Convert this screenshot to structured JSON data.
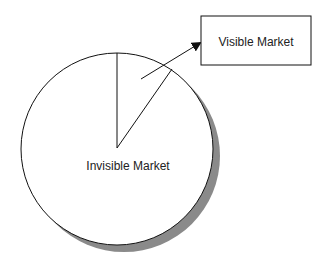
{
  "diagram": {
    "type": "pie-with-callout",
    "slices": [
      {
        "label": "Invisible Market",
        "share_approx": 0.9
      },
      {
        "label": "Visible Market",
        "share_approx": 0.1
      }
    ],
    "labels": {
      "invisible": "Invisible Market",
      "visible": "Visible Market"
    },
    "colors": {
      "stroke": "#111111",
      "fill": "#ffffff",
      "shadow": "#8a8a8a"
    }
  }
}
